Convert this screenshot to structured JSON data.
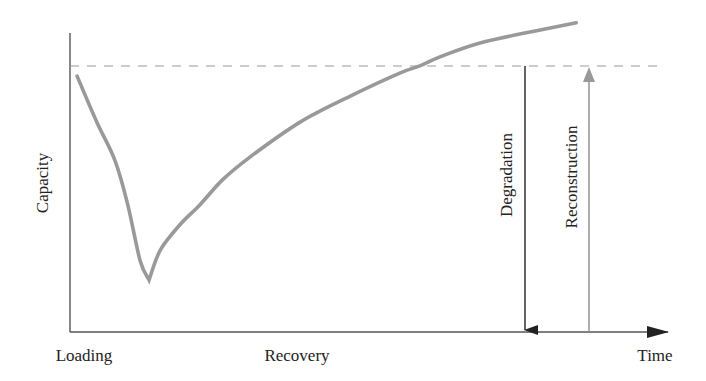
{
  "chart_data": {
    "type": "line",
    "title": "",
    "xlabel": "Time",
    "ylabel": "Capacity",
    "x_phase_labels": [
      "Loading",
      "Recovery"
    ],
    "xlim": [
      0,
      10
    ],
    "ylim": [
      0,
      10
    ],
    "grid": false,
    "legend": null,
    "series": [
      {
        "name": "Capacity curve",
        "color": "#999999",
        "points": [
          {
            "x": 0.12,
            "y": 8.56
          },
          {
            "x": 0.46,
            "y": 7.0
          },
          {
            "x": 0.76,
            "y": 5.75
          },
          {
            "x": 0.98,
            "y": 4.25
          },
          {
            "x": 1.19,
            "y": 2.37
          },
          {
            "x": 1.34,
            "y": 1.74
          },
          {
            "x": 1.53,
            "y": 2.74
          },
          {
            "x": 1.86,
            "y": 3.58
          },
          {
            "x": 2.2,
            "y": 4.25
          },
          {
            "x": 2.58,
            "y": 5.08
          },
          {
            "x": 3.05,
            "y": 5.85
          },
          {
            "x": 3.9,
            "y": 7.02
          },
          {
            "x": 4.75,
            "y": 7.89
          },
          {
            "x": 5.59,
            "y": 8.66
          },
          {
            "x": 5.93,
            "y": 8.9
          },
          {
            "x": 6.27,
            "y": 9.2
          },
          {
            "x": 6.95,
            "y": 9.67
          },
          {
            "x": 7.97,
            "y": 10.1
          },
          {
            "x": 8.58,
            "y": 10.34
          }
        ]
      }
    ],
    "reference_lines": [
      {
        "type": "horizontal",
        "name": "Original capacity level",
        "y": 8.9,
        "style": "dashed",
        "color": "#999999"
      }
    ],
    "annotations": [
      {
        "type": "arrow",
        "label": "Degradation",
        "direction": "down",
        "x": 7.71,
        "y_from": 8.9,
        "y_to": 0,
        "color": "#222222"
      },
      {
        "type": "arrow",
        "label": "Reconstruction",
        "direction": "up",
        "x": 8.78,
        "y_from": 0,
        "y_to": 8.9,
        "color": "#999999"
      }
    ]
  },
  "labels": {
    "y_axis": "Capacity",
    "x_axis": "Time",
    "phase_loading": "Loading",
    "phase_recovery": "Recovery",
    "degradation": "Degradation",
    "reconstruction": "Reconstruction"
  },
  "colors": {
    "axis": "#555555",
    "curve": "#999999",
    "dashed": "#999999",
    "degradation_arrow": "#222222",
    "reconstruction_arrow": "#999999"
  }
}
